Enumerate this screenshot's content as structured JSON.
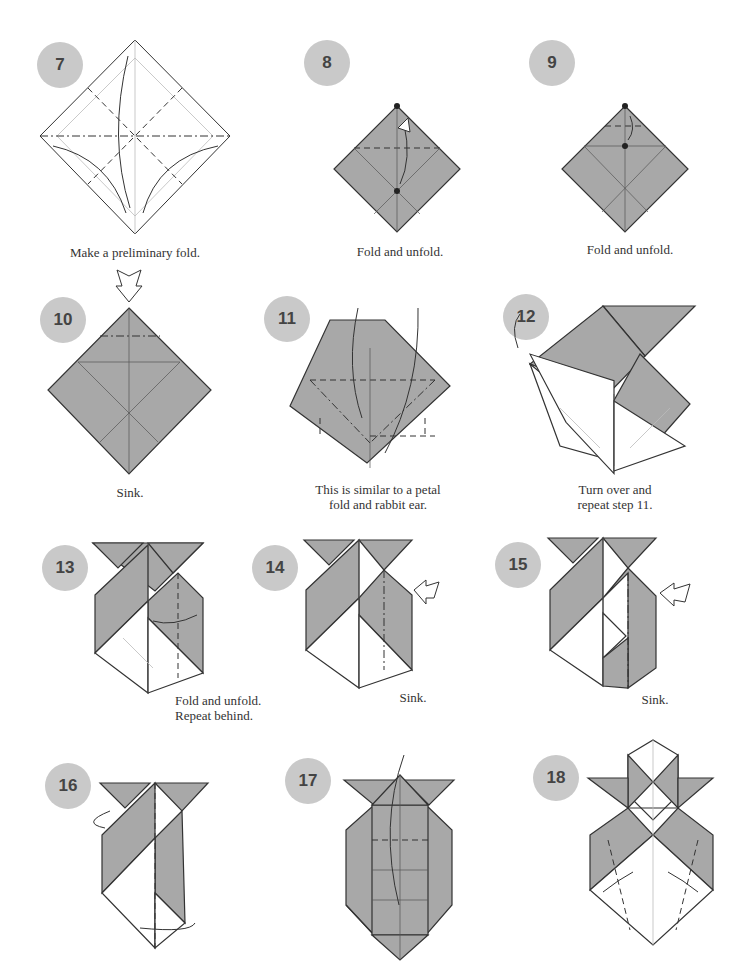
{
  "page": {
    "background": "#ffffff",
    "badge_color": "#c9c9c9",
    "paper_color": "#a8a8a8"
  },
  "steps": [
    {
      "number": "7",
      "caption": "Make a preliminary fold."
    },
    {
      "number": "8",
      "caption": "Fold and unfold."
    },
    {
      "number": "9",
      "caption": "Fold and unfold."
    },
    {
      "number": "10",
      "caption": "Sink."
    },
    {
      "number": "11",
      "caption": "This is similar to a petal\nfold and rabbit ear."
    },
    {
      "number": "12",
      "caption": "Turn over and\nrepeat step 11."
    },
    {
      "number": "13",
      "caption": "Fold and unfold.\nRepeat behind."
    },
    {
      "number": "14",
      "caption": "Sink."
    },
    {
      "number": "15",
      "caption": "Sink."
    },
    {
      "number": "16",
      "caption": ""
    },
    {
      "number": "17",
      "caption": ""
    },
    {
      "number": "18",
      "caption": ""
    }
  ],
  "icons": {
    "sink_arrow": "hollow-push-arrow",
    "fold_arrow": "curved-arrow",
    "turn_over": "turn-over-arrow"
  }
}
